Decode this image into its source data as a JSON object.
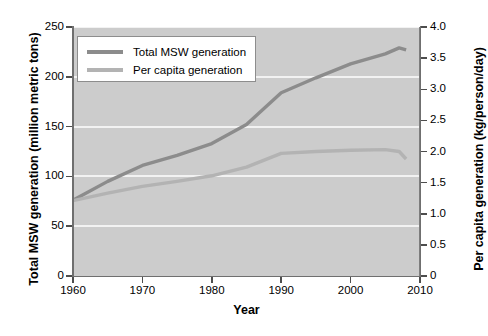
{
  "chart_data": {
    "type": "line",
    "title": "",
    "xlabel": "Year",
    "ylabel_left": "Total MSW generation (million metric tons)",
    "ylabel_right": "Per capita generation (kg/person/day)",
    "grid": true,
    "legend_position": "upper-left-inside",
    "xlim": [
      1960,
      2010
    ],
    "xticks": [
      1960,
      1970,
      1980,
      1990,
      2000,
      2010
    ],
    "xticklabels": [
      "1960",
      "1970",
      "1980",
      "1990",
      "2000",
      "2010"
    ],
    "ylim_left": [
      0,
      250
    ],
    "yticks_left": [
      0,
      50,
      100,
      150,
      200,
      250
    ],
    "yticklabels_left": [
      "0",
      "50",
      "100",
      "150",
      "200",
      "250"
    ],
    "ylim_right": [
      0,
      4.0
    ],
    "yticks_right": [
      0,
      0.5,
      1.0,
      1.5,
      2.0,
      2.5,
      3.0,
      3.5,
      4.0
    ],
    "yticklabels_right": [
      "0",
      "0.5",
      "1.0",
      "1.5",
      "2.0",
      "2.5",
      "3.0",
      "3.5",
      "4.0"
    ],
    "x": [
      1960,
      1965,
      1970,
      1975,
      1980,
      1985,
      1990,
      1995,
      2000,
      2005,
      2007,
      2008
    ],
    "series": [
      {
        "name": "Total MSW generation",
        "axis": "left",
        "color": "#8c8c8c",
        "units": "million metric tons",
        "values": [
          76,
          95,
          111,
          121,
          133,
          152,
          184,
          199,
          213,
          223,
          229,
          227
        ]
      },
      {
        "name": "Per capita generation",
        "axis": "right",
        "color": "#b3b3b3",
        "units": "kg/person/day",
        "values": [
          1.21,
          1.33,
          1.44,
          1.52,
          1.61,
          1.75,
          1.97,
          2.0,
          2.02,
          2.03,
          2.0,
          1.88
        ]
      }
    ],
    "legend": [
      {
        "label": "Total MSW generation",
        "color": "#8c8c8c"
      },
      {
        "label": "Per capita generation",
        "color": "#b3b3b3"
      }
    ],
    "colors": {
      "plot_background": "#cccccc",
      "gridline": "#f2f2f2",
      "axis": "#6f6f6f",
      "figure_background": "#ffffff",
      "series_total": "#8c8c8c",
      "series_percapita": "#b3b3b3"
    }
  }
}
